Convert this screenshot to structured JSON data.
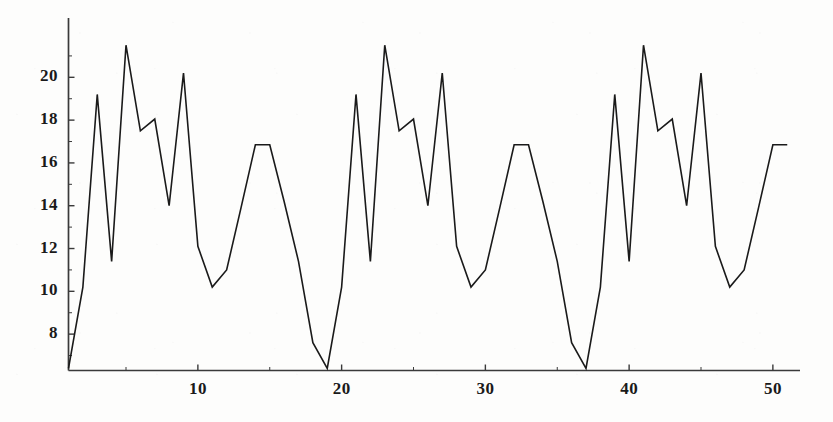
{
  "chart_data": {
    "type": "line",
    "title": "",
    "subtitle": "",
    "xlabel": "",
    "ylabel": "",
    "grid": false,
    "legend": null,
    "legend_position": "none",
    "line_color": "#1a1a1a",
    "background_color": "#fdfdfc",
    "axis_color": "#3a3a3a",
    "xlim": [
      1,
      51
    ],
    "ylim": [
      6.3,
      21.8
    ],
    "xticks": [
      10,
      20,
      30,
      40,
      50
    ],
    "xtick_labels": [
      "10",
      "20",
      "30",
      "40",
      "50"
    ],
    "yticks": [
      8,
      10,
      12,
      14,
      16,
      18,
      20
    ],
    "ytick_labels": [
      "8",
      "10",
      "12",
      "14",
      "16",
      "18",
      "20"
    ],
    "y_minor_ticks": [
      7,
      9,
      11,
      13,
      15,
      17,
      19,
      21
    ],
    "period": 18,
    "x": [
      1,
      2,
      3,
      4,
      5,
      6,
      7,
      8,
      9,
      10,
      11,
      12,
      13,
      14,
      15,
      16,
      17,
      18,
      19,
      20,
      21,
      22,
      23,
      24,
      25,
      26,
      27,
      28,
      29,
      30,
      31,
      32,
      33,
      34,
      35,
      36,
      37,
      38,
      39,
      40,
      41,
      42,
      43,
      44,
      45,
      46,
      47,
      48,
      49,
      50,
      51
    ],
    "values": [
      6.4,
      10.2,
      19.2,
      11.4,
      21.5,
      17.5,
      18.05,
      14.0,
      20.2,
      12.1,
      10.2,
      11.0,
      13.9,
      16.85,
      16.85,
      14.2,
      11.4,
      7.6,
      6.4,
      10.2,
      19.2,
      11.4,
      21.5,
      17.5,
      18.05,
      14.0,
      20.2,
      12.1,
      10.2,
      11.0,
      13.9,
      16.85,
      16.85,
      14.2,
      11.4,
      7.6,
      6.4,
      10.2,
      19.2,
      11.4,
      21.5,
      17.5,
      18.05,
      14.0,
      20.2,
      12.1,
      10.2,
      11.0,
      13.9,
      16.85,
      16.85
    ]
  }
}
